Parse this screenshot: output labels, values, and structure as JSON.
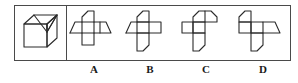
{
  "question": {
    "type": "spatial-reasoning-cube-net",
    "prompt_visible": "",
    "stem_panel": {
      "name": "cube-solid",
      "description": "isometric cube with diagonal lines on top-right face forming a triangle"
    },
    "options": [
      {
        "key": "A",
        "label": "A",
        "shape_name": "cube-net-a",
        "description": "cross net, horizontal arm extended right, notched top square"
      },
      {
        "key": "B",
        "label": "B",
        "shape_name": "cube-net-b",
        "description": "cross net, notched top and bottom squares, right arm"
      },
      {
        "key": "C",
        "label": "C",
        "shape_name": "cube-net-c",
        "description": "cross net, notched top-right and bottom squares, left arm"
      },
      {
        "key": "D",
        "label": "D",
        "shape_name": "cube-net-d",
        "description": "cross net, notched top-left, right arm, notched bottom square"
      }
    ]
  },
  "colors": {
    "stroke": "#2b2b2b",
    "frame": "#4a4a4a",
    "background": "#ffffff",
    "text": "#1a1a1a"
  }
}
